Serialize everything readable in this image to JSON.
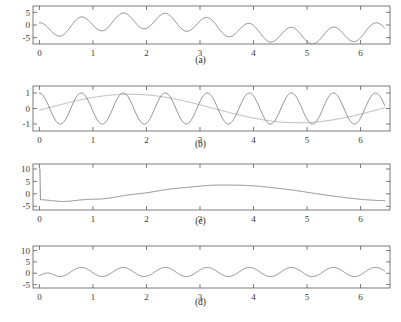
{
  "figure": {
    "title_cropped": "",
    "background": "#ffffff",
    "curve_color": "#6e6e6e",
    "secondary_curve_color": "#a8a8a8",
    "axis_color": "#5a5a5a"
  },
  "chart_data": [
    {
      "id": "panel-a",
      "type": "line",
      "title": "",
      "caption": "(a)",
      "xlabel": "",
      "ylabel": "",
      "xlim": [
        -0.12,
        6.55
      ],
      "ylim": [
        -7.5,
        7.5
      ],
      "xticks": [
        0,
        1,
        2,
        3,
        4,
        5,
        6
      ],
      "xticklabels": [
        "0",
        "1",
        "2",
        "3",
        "4",
        "5",
        "6"
      ],
      "yticks": [
        5,
        0,
        -5
      ],
      "yticklabels": [
        "5",
        "0",
        "-5"
      ],
      "grid": false,
      "legend": "none",
      "series": [
        {
          "name": "modulated-oscillation",
          "formula": "3.2*sin(8*x + 1.6) + 3.0*sin(x - 0.35) - 1.3",
          "n": 700,
          "color": "#6e6e6e"
        }
      ]
    },
    {
      "id": "panel-b",
      "type": "line",
      "title": "",
      "caption": "(b)",
      "xlabel": "",
      "ylabel": "",
      "xlim": [
        -0.12,
        6.55
      ],
      "ylim": [
        -1.45,
        1.45
      ],
      "xticks": [
        0,
        1,
        2,
        3,
        4,
        5,
        6
      ],
      "xticklabels": [
        "0",
        "1",
        "2",
        "3",
        "4",
        "5",
        "6"
      ],
      "yticks": [
        1,
        0,
        -1
      ],
      "yticklabels": [
        "1",
        "0",
        "-1"
      ],
      "grid": false,
      "legend": "none",
      "series": [
        {
          "name": "high-frequency-sine",
          "formula": "1.0*sin(8*x + 1.6)",
          "n": 900,
          "color": "#6e6e6e"
        },
        {
          "name": "low-frequency-sine",
          "formula": "0.92*sin(x - 0.12)",
          "n": 400,
          "color": "#a8a8a8"
        }
      ]
    },
    {
      "id": "panel-c",
      "type": "line",
      "title": "",
      "caption": "(c)",
      "xlabel": "",
      "ylabel": "",
      "xlim": [
        -0.12,
        6.55
      ],
      "ylim": [
        -6.5,
        12.0
      ],
      "xticks": [
        0,
        1,
        2,
        3,
        4,
        5,
        6
      ],
      "xticklabels": [
        "0",
        "1",
        "2",
        "3",
        "4",
        "5",
        "6"
      ],
      "yticks": [
        10,
        5,
        0,
        -5
      ],
      "yticklabels": [
        "10",
        "5",
        "0",
        "-5"
      ],
      "grid": false,
      "legend": "none",
      "series": [
        {
          "name": "low-frequency-envelope-with-startup-spike",
          "formula": "spike(10 at x=0) then 3.2*sin(x - 1.9) + 0.35 with small ripple",
          "n": 700,
          "color": "#6e6e6e"
        }
      ]
    },
    {
      "id": "panel-d",
      "type": "line",
      "title": "",
      "caption": "(d)",
      "xlabel": "",
      "ylabel": "",
      "xlim": [
        -0.12,
        6.55
      ],
      "ylim": [
        -6.5,
        12.0
      ],
      "xticks": [
        0,
        1,
        2,
        3,
        4,
        5,
        6
      ],
      "xticklabels": [
        "0",
        "1",
        "2",
        "3",
        "4",
        "5",
        "6"
      ],
      "yticks": [
        10,
        5,
        0,
        -5
      ],
      "yticklabels": [
        "10",
        "5",
        "0",
        "-5"
      ],
      "grid": false,
      "legend": "none",
      "series": [
        {
          "name": "ripple-oscillation",
          "formula": "step(-1 at x=0) then 2.0*sin(8*x + 1.6) + 0.55",
          "n": 800,
          "color": "#6e6e6e"
        }
      ]
    }
  ],
  "layout": {
    "panel_tops": [
      5,
      85,
      163,
      245
    ],
    "plot_height": [
      38,
      45,
      46,
      42
    ],
    "plot_left": 33,
    "plot_right": 390,
    "caption_tops": [
      55,
      139,
      216,
      297
    ]
  }
}
